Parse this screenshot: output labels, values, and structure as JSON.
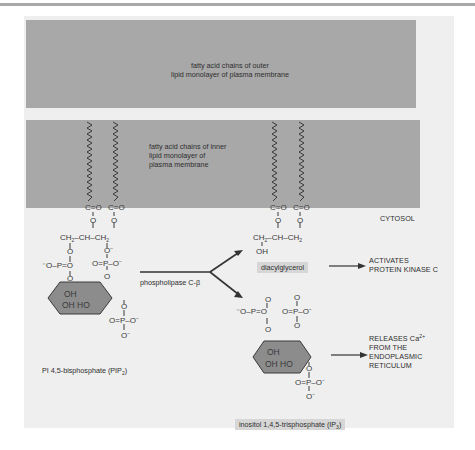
{
  "figure": {
    "colors": {
      "membrane_band": "#a8a8a8",
      "panel_background": "#efefef",
      "inositol_ring": "#8c8c8c",
      "text": "#2e2e2e",
      "label_box": "#d6d6d6"
    },
    "membrane": {
      "outer_label_line1": "fatty acid chains of outer",
      "outer_label_line2": "lipid monolayer of plasma membrane",
      "inner_label_line1": "fatty acid chains of inner",
      "inner_label_line2": "lipid monolayer of",
      "inner_label_line3": "plasma membrane",
      "cytosol_label": "CYTOSOL"
    },
    "reactant": {
      "name": "PI 4,5-bisphosphate (PIP",
      "name_sub": "2",
      "name_end": ")",
      "ester_left": "C=O",
      "ester_right": "C=O",
      "glycerol": "CH2–CH–CH2",
      "ring_oh_top": "OH",
      "ring_oh_bottom": "OH HO"
    },
    "enzyme": {
      "label": "phospholipase C-β"
    },
    "products": {
      "dag": {
        "name": "diacylglycerol",
        "effect_line1": "ACTIVATES",
        "effect_line2": "PROTEIN KINASE C",
        "glycerol": "CH2–CH–CH2",
        "hydroxyl": "OH"
      },
      "ip3": {
        "name": "inositol 1,4,5-trisphosphate (IP",
        "name_sub": "3",
        "name_end": ")",
        "effect_line1": "RELEASES Ca",
        "effect_line1_sup": "2+",
        "effect_line2": "FROM THE",
        "effect_line3": "ENDOPLASMIC",
        "effect_line4": "RETICULUM"
      }
    }
  }
}
